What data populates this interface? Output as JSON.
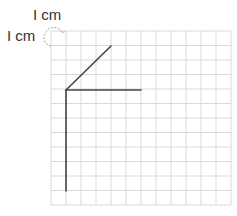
{
  "labels": {
    "top": "I cm",
    "left": "I cm"
  },
  "grid": {
    "x0": 51,
    "y0": 31,
    "cols": 12,
    "rows": 12,
    "cell_w": 15,
    "cell_h": 14.5,
    "line_color": "#d9d9d9"
  },
  "segments": [
    {
      "name": "diagonal-segment",
      "x1": 66,
      "y1": 90,
      "x2": 111,
      "y2": 46
    },
    {
      "name": "horizontal-segment",
      "x1": 66,
      "y1": 90,
      "x2": 141,
      "y2": 90
    },
    {
      "name": "vertical-segment",
      "x1": 66,
      "y1": 90,
      "x2": 66,
      "y2": 191
    }
  ],
  "colors": {
    "segment": "#444444",
    "dashed_marker": "#999999"
  }
}
